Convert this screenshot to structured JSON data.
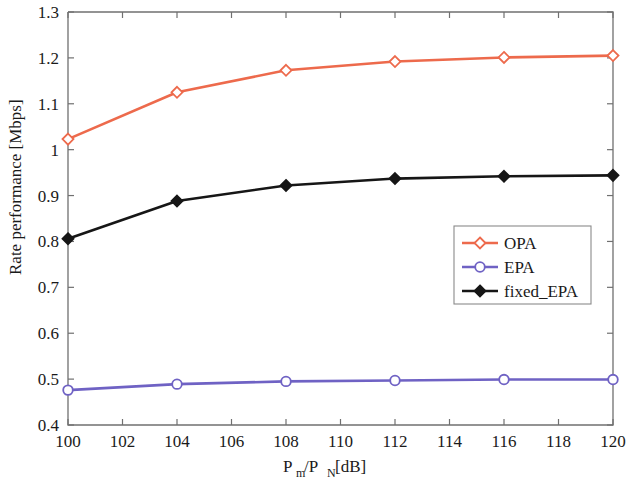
{
  "chart_data": {
    "type": "line",
    "title": "",
    "xlabel": "P_m/P_N [dB]",
    "xlabel_parts": {
      "p1": "P",
      "sub1": "m",
      "slash": "/P",
      "sub2": "N",
      "unit": " [dB]"
    },
    "ylabel": "Rate performance [Mbps]",
    "x": [
      100,
      104,
      108,
      112,
      116,
      120
    ],
    "xlim": [
      100,
      120
    ],
    "ylim": [
      0.4,
      1.3
    ],
    "xticks": [
      100,
      102,
      104,
      106,
      108,
      110,
      112,
      114,
      116,
      118,
      120
    ],
    "xtick_labels": [
      "100",
      "102",
      "104",
      "106",
      "108",
      "110",
      "112",
      "114",
      "116",
      "118",
      "120"
    ],
    "yticks": [
      0.4,
      0.5,
      0.6,
      0.7,
      0.8,
      0.9,
      1.0,
      1.1,
      1.2,
      1.3
    ],
    "ytick_labels": [
      "0.4",
      "0.5",
      "0.6",
      "0.7",
      "0.8",
      "0.9",
      "1",
      "1.1",
      "1.2",
      "1.3"
    ],
    "grid": false,
    "legend_position": "center-right",
    "series": [
      {
        "name": "OPA",
        "color": "#ED6A4C",
        "marker": "diamond-open",
        "values": [
          1.023,
          1.125,
          1.173,
          1.192,
          1.201,
          1.205
        ]
      },
      {
        "name": "EPA",
        "color": "#6F62C4",
        "marker": "circle-open",
        "values": [
          0.476,
          0.489,
          0.495,
          0.497,
          0.499,
          0.499
        ]
      },
      {
        "name": "fixed_EPA",
        "color": "#161616",
        "marker": "diamond-filled",
        "values": [
          0.806,
          0.888,
          0.922,
          0.937,
          0.942,
          0.944
        ]
      }
    ]
  },
  "legend": {
    "entries": [
      {
        "label": "OPA"
      },
      {
        "label": "EPA"
      },
      {
        "label": "fixed_EPA"
      }
    ]
  }
}
